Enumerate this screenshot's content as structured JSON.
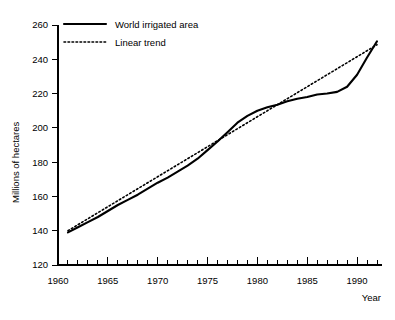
{
  "chart_data": {
    "type": "line",
    "title": "",
    "xlabel": "Year",
    "ylabel": "Millions of hectares",
    "xlim": [
      1960,
      1992.5
    ],
    "ylim": [
      120,
      260
    ],
    "xticks": [
      1960,
      1965,
      1970,
      1975,
      1980,
      1985,
      1990
    ],
    "xtick_labels": [
      "1960",
      "1965",
      "1970",
      "1975",
      "1980",
      "1985",
      "1990"
    ],
    "yticks": [
      120,
      140,
      160,
      180,
      200,
      220,
      240,
      260
    ],
    "ytick_labels": [
      "120",
      "140",
      "160",
      "180",
      "200",
      "220",
      "240",
      "260"
    ],
    "minor_xticks_every": 1,
    "grid": false,
    "legend_position": "top-left",
    "x": [
      1961,
      1962,
      1963,
      1964,
      1965,
      1966,
      1967,
      1968,
      1969,
      1970,
      1971,
      1972,
      1973,
      1974,
      1975,
      1976,
      1977,
      1978,
      1979,
      1980,
      1981,
      1982,
      1983,
      1984,
      1985,
      1986,
      1987,
      1988,
      1989,
      1990,
      1991,
      1992
    ],
    "series": [
      {
        "name": "World irrigated area",
        "style": "solid",
        "color": "#000000",
        "values": [
          139.0,
          142.0,
          145.0,
          148.0,
          151.5,
          155.0,
          158.0,
          161.0,
          164.5,
          168.0,
          171.0,
          174.5,
          178.0,
          182.0,
          187.0,
          192.0,
          197.5,
          203.0,
          207.0,
          210.0,
          212.0,
          213.5,
          215.5,
          217.0,
          218.0,
          219.5,
          220.0,
          221.0,
          224.0,
          231.0,
          241.0,
          250.5
        ]
      },
      {
        "name": "Linear trend",
        "style": "dotted",
        "color": "#000000",
        "values": [
          140.0,
          143.5,
          147.0,
          150.5,
          154.0,
          157.5,
          161.0,
          164.5,
          168.0,
          171.5,
          175.0,
          178.5,
          182.0,
          185.5,
          189.0,
          192.5,
          196.0,
          199.5,
          203.0,
          206.5,
          210.0,
          213.5,
          217.0,
          220.5,
          224.0,
          227.5,
          231.0,
          234.5,
          238.0,
          241.5,
          245.0,
          248.5
        ]
      }
    ]
  },
  "legend": {
    "items": [
      {
        "label": "World irrigated area",
        "style": "solid"
      },
      {
        "label": "Linear trend",
        "style": "dotted"
      }
    ]
  }
}
